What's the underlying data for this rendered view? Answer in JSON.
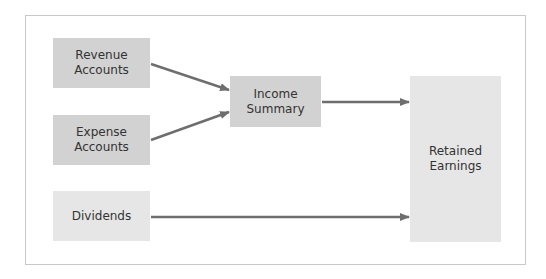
{
  "diagram": {
    "nodes": [
      {
        "id": "revenue",
        "label": "Revenue\nAccounts"
      },
      {
        "id": "expense",
        "label": "Expense\nAccounts"
      },
      {
        "id": "dividends",
        "label": "Dividends"
      },
      {
        "id": "income_summary",
        "label": "Income\nSummary"
      },
      {
        "id": "retained_earnings",
        "label": "Retained\nEarnings"
      }
    ],
    "edges": [
      {
        "from": "revenue",
        "to": "income_summary"
      },
      {
        "from": "expense",
        "to": "income_summary"
      },
      {
        "from": "income_summary",
        "to": "retained_earnings"
      },
      {
        "from": "dividends",
        "to": "retained_earnings"
      }
    ],
    "colors": {
      "box_dark": "#d2d2d2",
      "box_light": "#e6e6e6",
      "arrow": "#6e6e6e",
      "frame_border": "#c8c8c8"
    }
  }
}
